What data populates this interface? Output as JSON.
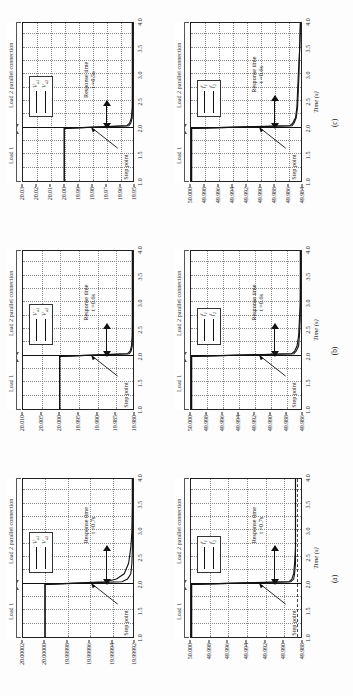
{
  "figure": {
    "orientation": "rotated-90-ccw",
    "columns": [
      {
        "id": "a",
        "caption": "(a)",
        "panels": [
          {
            "id": "a-top",
            "quantity": "voltage",
            "yticks": [
              "20.00002",
              "20.00000",
              "19.99998",
              "19.99996",
              "19.99994",
              "19.99992"
            ],
            "legend": [
              "V",
              "V"
            ],
            "legend_subs": [
              "o1",
              "o2"
            ],
            "response_label": "Response time",
            "response_value": "t =0.7s",
            "step_label": "Step point"
          },
          {
            "id": "a-bottom",
            "quantity": "frequency",
            "yticks": [
              "50.000",
              "49.998",
              "49.996",
              "49.994",
              "49.992",
              "49.990",
              "49.988"
            ],
            "legend": [
              "f",
              "f"
            ],
            "legend_subs": [
              "1",
              "2"
            ],
            "response_label": "Response time",
            "response_value": "t =0.7s",
            "step_label": "Step point"
          }
        ]
      },
      {
        "id": "b",
        "caption": "(b)",
        "panels": [
          {
            "id": "b-top",
            "quantity": "voltage",
            "yticks": [
              "20.010",
              "20.005",
              "20.000",
              "19.995",
              "19.990",
              "19.985",
              "19.980"
            ],
            "legend": [
              "V",
              "V"
            ],
            "legend_subs": [
              "o1",
              "o2"
            ],
            "response_label": "Response time",
            "response_value": "t =0.6s",
            "step_label": "Step point"
          },
          {
            "id": "b-bottom",
            "quantity": "frequency",
            "yticks": [
              "50.000",
              "49.998",
              "49.996",
              "49.994",
              "49.992",
              "49.990",
              "49.988",
              "49.986"
            ],
            "legend": [
              "f",
              "f"
            ],
            "legend_subs": [
              "1",
              "2"
            ],
            "response_label": "Response time",
            "response_value": "t =0.6s",
            "step_label": "Step point"
          }
        ]
      },
      {
        "id": "c",
        "caption": "(c)",
        "panels": [
          {
            "id": "c-top",
            "quantity": "voltage",
            "yticks": [
              "20.03",
              "20.02",
              "20.01",
              "20.00",
              "19.99",
              "19.98",
              "19.97",
              "19.96",
              "19.95"
            ],
            "legend": [
              "V",
              "V"
            ],
            "legend_subs": [
              "o1",
              "o2"
            ],
            "response_label": "Response time",
            "response_value": "t =0.5s",
            "step_label": "Step point"
          },
          {
            "id": "c-bottom",
            "quantity": "frequency",
            "yticks": [
              "50.000",
              "49.998",
              "49.996",
              "49.994",
              "49.992",
              "49.990",
              "49.988",
              "49.986",
              "49.984"
            ],
            "legend": [
              "f",
              "f"
            ],
            "legend_subs": [
              "1",
              "2"
            ],
            "response_label": "Response time",
            "response_value": "t =0.6s",
            "step_label": "Step point"
          }
        ]
      }
    ],
    "shared": {
      "xticks": [
        "1.0",
        "1.5",
        "2.0",
        "2.5",
        "3.0",
        "3.5",
        "4.0"
      ],
      "xlabel_symbol": "Time",
      "xlabel_unit": "(s)",
      "span_load1": "Load 1",
      "span_load2": "Load 2 parallel connection"
    }
  },
  "chart_data": {
    "type": "line",
    "title": "",
    "xlabel": "Time (s)",
    "xlim": [
      1.0,
      4.0
    ],
    "grid": true,
    "legend_position": "top-right-inset",
    "panels": [
      {
        "id": "a-top",
        "ylabel": "Vo1 / Vo2 (V)",
        "ylim": [
          19.99992,
          20.00002
        ],
        "yticks": [
          20.00002,
          20.0,
          19.99998,
          19.99996,
          19.99994,
          19.99992
        ],
        "step_time": 2.0,
        "response_time_s": 0.7,
        "series": [
          {
            "name": "Vo1",
            "x": [
              1.0,
              1.5,
              2.0,
              2.05,
              2.1,
              2.2,
              2.4,
              2.7,
              3.0,
              3.5,
              4.0
            ],
            "y": [
              20.0,
              20.0,
              20.0,
              19.999945,
              19.999935,
              19.999928,
              19.999924,
              19.999922,
              19.999921,
              19.99992,
              19.99992
            ]
          },
          {
            "name": "Vo2",
            "x": [
              1.0,
              1.5,
              2.0,
              2.05,
              2.1,
              2.2,
              2.4,
              2.7,
              3.0,
              3.5,
              4.0
            ],
            "y": [
              20.0,
              20.0,
              20.0,
              19.99993,
              19.999925,
              19.999922,
              19.999921,
              19.99992,
              19.99992,
              19.99992,
              19.99992
            ]
          }
        ]
      },
      {
        "id": "a-bottom",
        "ylabel": "f1 / f2 (Hz)",
        "ylim": [
          49.988,
          50.0
        ],
        "yticks": [
          50.0,
          49.998,
          49.996,
          49.994,
          49.992,
          49.99,
          49.988
        ],
        "step_time": 2.0,
        "response_time_s": 0.7,
        "series": [
          {
            "name": "f1",
            "x": [
              1.0,
              1.5,
              2.0,
              2.05,
              2.1,
              2.2,
              2.4,
              2.7,
              3.0,
              3.5,
              4.0
            ],
            "y": [
              50.0,
              50.0,
              50.0,
              49.9893,
              49.989,
              49.9888,
              49.9887,
              49.9886,
              49.9886,
              49.9886,
              49.9886
            ]
          },
          {
            "name": "f2",
            "x": [
              1.0,
              1.5,
              2.0,
              2.05,
              2.1,
              2.2,
              2.4,
              2.7,
              3.0,
              3.5,
              4.0
            ],
            "y": [
              50.0,
              50.0,
              50.0,
              49.9891,
              49.9888,
              49.9887,
              49.9886,
              49.9886,
              49.9886,
              49.9886,
              49.9886
            ]
          }
        ]
      },
      {
        "id": "b-top",
        "ylabel": "Vo1 / Vo2 (V)",
        "ylim": [
          19.98,
          20.01
        ],
        "yticks": [
          20.01,
          20.005,
          20.0,
          19.995,
          19.99,
          19.985,
          19.98
        ],
        "step_time": 2.0,
        "response_time_s": 0.6,
        "series": [
          {
            "name": "Vo1",
            "x": [
              1.0,
              1.5,
              2.0,
              2.05,
              2.1,
              2.2,
              2.4,
              2.7,
              3.0,
              3.5,
              4.0
            ],
            "y": [
              20.0,
              20.0,
              20.0,
              19.9815,
              19.9808,
              19.9804,
              19.9802,
              19.9801,
              19.98,
              19.98,
              19.98
            ]
          },
          {
            "name": "Vo2",
            "x": [
              1.0,
              1.5,
              2.0,
              2.05,
              2.1,
              2.2,
              2.4,
              2.7,
              3.0,
              3.5,
              4.0
            ],
            "y": [
              20.0,
              20.0,
              20.0,
              19.981,
              19.9805,
              19.9802,
              19.9801,
              19.98,
              19.98,
              19.98,
              19.98
            ]
          }
        ]
      },
      {
        "id": "b-bottom",
        "ylabel": "f1 / f2 (Hz)",
        "ylim": [
          49.986,
          50.0
        ],
        "yticks": [
          50.0,
          49.998,
          49.996,
          49.994,
          49.992,
          49.99,
          49.988,
          49.986
        ],
        "step_time": 2.0,
        "response_time_s": 0.6,
        "series": [
          {
            "name": "f1",
            "x": [
              1.0,
              1.5,
              2.0,
              2.05,
              2.1,
              2.2,
              2.4,
              2.7,
              3.0,
              3.5,
              4.0
            ],
            "y": [
              50.0,
              50.0,
              50.0,
              49.9872,
              49.9868,
              49.9865,
              49.9863,
              49.9862,
              49.9861,
              49.986,
              49.986
            ]
          },
          {
            "name": "f2",
            "x": [
              1.0,
              1.5,
              2.0,
              2.05,
              2.1,
              2.2,
              2.4,
              2.7,
              3.0,
              3.5,
              4.0
            ],
            "y": [
              50.0,
              50.0,
              50.0,
              49.9869,
              49.9866,
              49.9863,
              49.9862,
              49.9861,
              49.986,
              49.986,
              49.986
            ]
          }
        ]
      },
      {
        "id": "c-top",
        "ylabel": "Vo1 / Vo2 (V)",
        "ylim": [
          19.95,
          20.03
        ],
        "yticks": [
          20.03,
          20.02,
          20.01,
          20.0,
          19.99,
          19.98,
          19.97,
          19.96,
          19.95
        ],
        "step_time": 2.0,
        "response_time_s": 0.5,
        "series": [
          {
            "name": "Vo1",
            "x": [
              1.0,
              1.5,
              2.0,
              2.05,
              2.1,
              2.2,
              2.4,
              2.7,
              3.0,
              3.5,
              4.0
            ],
            "y": [
              20.0,
              20.0,
              20.0,
              19.9545,
              19.9525,
              19.9512,
              19.9505,
              19.9502,
              19.9501,
              19.95,
              19.95
            ]
          },
          {
            "name": "Vo2",
            "x": [
              1.0,
              1.5,
              2.0,
              2.05,
              2.1,
              2.2,
              2.4,
              2.7,
              3.0,
              3.5,
              4.0
            ],
            "y": [
              20.0,
              20.0,
              20.0,
              19.953,
              19.9516,
              19.9506,
              19.9502,
              19.9501,
              19.95,
              19.95,
              19.95
            ]
          }
        ]
      },
      {
        "id": "c-bottom",
        "ylabel": "f1 / f2 (Hz)",
        "ylim": [
          49.984,
          50.0
        ],
        "yticks": [
          50.0,
          49.998,
          49.996,
          49.994,
          49.992,
          49.99,
          49.988,
          49.986,
          49.984
        ],
        "step_time": 2.0,
        "response_time_s": 0.6,
        "series": [
          {
            "name": "f1",
            "x": [
              1.0,
              1.5,
              2.0,
              2.05,
              2.1,
              2.2,
              2.4,
              2.7,
              3.0,
              3.5,
              4.0
            ],
            "y": [
              50.0,
              50.0,
              50.0,
              49.9856,
              49.9852,
              49.9848,
              49.9846,
              49.9845,
              49.9844,
              49.9842,
              49.984
            ]
          },
          {
            "name": "f2",
            "x": [
              1.0,
              1.5,
              2.0,
              2.05,
              2.1,
              2.2,
              2.4,
              2.7,
              3.0,
              3.5,
              4.0
            ],
            "y": [
              50.0,
              50.0,
              50.0,
              49.9853,
              49.985,
              49.9847,
              49.9845,
              49.9844,
              49.9843,
              49.9842,
              49.984
            ]
          }
        ]
      }
    ]
  }
}
